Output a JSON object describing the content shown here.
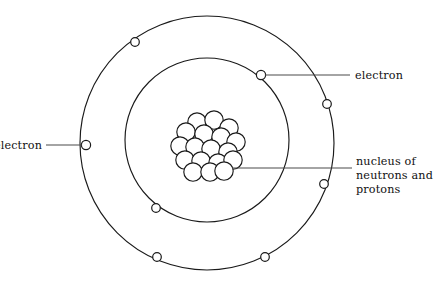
{
  "diagram": {
    "background_color": "#ffffff",
    "stroke_color": "#1a1a1a",
    "leader_color": "#4a4a4a",
    "text_color": "#111111"
  },
  "labels": {
    "electron_right": "electron",
    "electron_left": "electron",
    "nucleus_line1": "nucleus of",
    "nucleus_line2": "neutrons and",
    "nucleus_line3": "protons"
  },
  "chart_data": {
    "type": "diagram",
    "orbits": [
      {
        "name": "outer-shell",
        "cx": 207,
        "cy": 143,
        "r": 127,
        "electron_count": 6
      },
      {
        "name": "inner-shell",
        "cx": 207,
        "cy": 140,
        "r": 82,
        "electron_count": 2
      }
    ],
    "electrons": [
      {
        "shell": "outer",
        "cx": 135,
        "cy": 42,
        "r": 4.3
      },
      {
        "shell": "outer",
        "cx": 86,
        "cy": 145,
        "r": 4.6
      },
      {
        "shell": "outer",
        "cx": 327,
        "cy": 104,
        "r": 4.3
      },
      {
        "shell": "outer",
        "cx": 324,
        "cy": 184,
        "r": 4.3
      },
      {
        "shell": "outer",
        "cx": 157,
        "cy": 257,
        "r": 4.3
      },
      {
        "shell": "outer",
        "cx": 265,
        "cy": 257,
        "r": 4.3
      },
      {
        "shell": "inner",
        "cx": 261,
        "cy": 75,
        "r": 4.6
      },
      {
        "shell": "inner",
        "cx": 156,
        "cy": 208,
        "r": 4.3
      }
    ],
    "nucleus": {
      "cx": 207,
      "cy": 145,
      "particle_count": 18,
      "particle_radius": 9.2,
      "particles": [
        {
          "cx": 197,
          "cy": 122
        },
        {
          "cx": 214,
          "cy": 120
        },
        {
          "cx": 229,
          "cy": 128
        },
        {
          "cx": 186,
          "cy": 132
        },
        {
          "cx": 204,
          "cy": 134
        },
        {
          "cx": 221,
          "cy": 137
        },
        {
          "cx": 236,
          "cy": 142
        },
        {
          "cx": 180,
          "cy": 146
        },
        {
          "cx": 195,
          "cy": 147
        },
        {
          "cx": 211,
          "cy": 149
        },
        {
          "cx": 228,
          "cy": 152
        },
        {
          "cx": 185,
          "cy": 160
        },
        {
          "cx": 201,
          "cy": 161
        },
        {
          "cx": 218,
          "cy": 163
        },
        {
          "cx": 233,
          "cy": 160
        },
        {
          "cx": 193,
          "cy": 172
        },
        {
          "cx": 210,
          "cy": 172
        },
        {
          "cx": 224,
          "cy": 171
        }
      ]
    },
    "leader_lines": [
      {
        "for": "electron_right",
        "points": "265,75 350,75"
      },
      {
        "for": "electron_left",
        "points": "82,145 46,145"
      },
      {
        "for": "nucleus",
        "points": "232,168 352,168"
      }
    ],
    "label_positions": [
      {
        "for": "electron_right",
        "x": 355,
        "y": 79,
        "anchor": "start"
      },
      {
        "for": "electron_left",
        "x": 42,
        "y": 149,
        "anchor": "end"
      },
      {
        "for": "nucleus",
        "x": 356,
        "y": 165,
        "anchor": "start",
        "lines": 3,
        "line_height": 14
      }
    ]
  }
}
